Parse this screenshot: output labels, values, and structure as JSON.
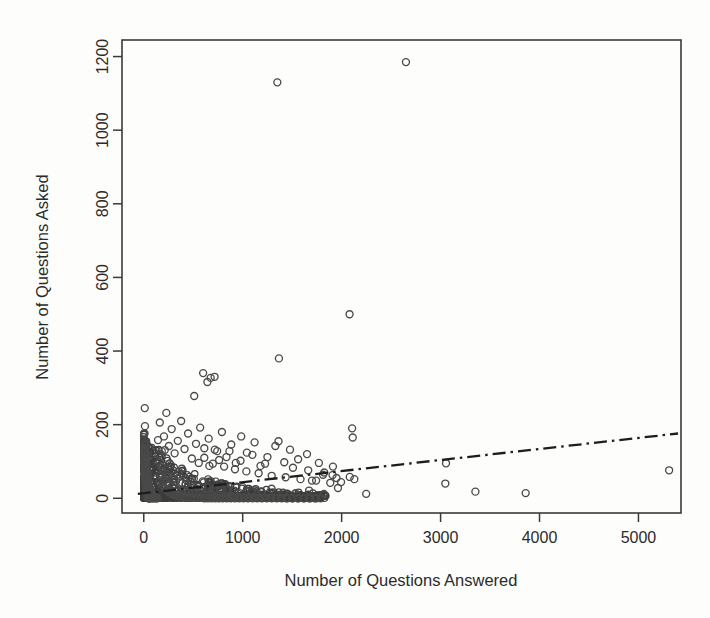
{
  "chart_data": {
    "type": "scatter",
    "title": "",
    "xlabel": "Number of Questions Answered",
    "ylabel": "Number of Questions Asked",
    "xlim": [
      -220,
      5430
    ],
    "ylim": [
      -40,
      1245
    ],
    "xticks": [
      0,
      1000,
      2000,
      3000,
      4000,
      5000
    ],
    "xticklabels": [
      "0",
      "1000",
      "2000",
      "3000",
      "4000",
      "5000"
    ],
    "yticks": [
      0,
      200,
      400,
      600,
      800,
      1000,
      1200
    ],
    "yticklabels": [
      "0",
      "200",
      "400",
      "600",
      "800",
      "1000",
      "1200"
    ],
    "grid": false,
    "legend": null,
    "marker": "open-circle",
    "marker_color": "#4a4a4a",
    "background": "#fdfdfc",
    "frame": "box",
    "series": [
      {
        "name": "users",
        "marker": "open-circle",
        "points": [
          [
            10,
            245
          ],
          [
            12,
            196
          ],
          [
            8,
            176
          ],
          [
            15,
            152
          ],
          [
            9,
            148
          ],
          [
            20,
            143
          ],
          [
            11,
            136
          ],
          [
            16,
            131
          ],
          [
            7,
            126
          ],
          [
            22,
            122
          ],
          [
            13,
            118
          ],
          [
            18,
            114
          ],
          [
            10,
            110
          ],
          [
            25,
            107
          ],
          [
            14,
            103
          ],
          [
            19,
            100
          ],
          [
            8,
            96
          ],
          [
            27,
            93
          ],
          [
            12,
            90
          ],
          [
            21,
            87
          ],
          [
            16,
            84
          ],
          [
            30,
            81
          ],
          [
            11,
            78
          ],
          [
            24,
            76
          ],
          [
            17,
            73
          ],
          [
            33,
            71
          ],
          [
            13,
            68
          ],
          [
            26,
            66
          ],
          [
            19,
            64
          ],
          [
            36,
            62
          ],
          [
            14,
            60
          ],
          [
            29,
            58
          ],
          [
            21,
            56
          ],
          [
            40,
            54
          ],
          [
            15,
            52
          ],
          [
            32,
            50
          ],
          [
            23,
            49
          ],
          [
            44,
            47
          ],
          [
            17,
            45
          ],
          [
            35,
            44
          ],
          [
            25,
            42
          ],
          [
            48,
            41
          ],
          [
            18,
            39
          ],
          [
            38,
            38
          ],
          [
            27,
            37
          ],
          [
            52,
            35
          ],
          [
            20,
            34
          ],
          [
            41,
            33
          ],
          [
            29,
            32
          ],
          [
            57,
            31
          ],
          [
            22,
            29
          ],
          [
            45,
            28
          ],
          [
            31,
            27
          ],
          [
            62,
            26
          ],
          [
            24,
            25
          ],
          [
            49,
            24
          ],
          [
            34,
            23
          ],
          [
            68,
            22
          ],
          [
            26,
            21
          ],
          [
            53,
            20
          ],
          [
            37,
            19
          ],
          [
            74,
            18
          ],
          [
            28,
            17
          ],
          [
            58,
            16
          ],
          [
            40,
            15
          ],
          [
            81,
            14
          ],
          [
            31,
            13
          ],
          [
            63,
            12
          ],
          [
            43,
            11
          ],
          [
            88,
            10
          ],
          [
            34,
            9
          ],
          [
            69,
            8
          ],
          [
            47,
            7
          ],
          [
            96,
            6
          ],
          [
            37,
            5
          ],
          [
            75,
            4
          ],
          [
            51,
            3
          ],
          [
            105,
            2
          ],
          [
            41,
            1
          ],
          [
            82,
            1
          ],
          [
            56,
            0
          ],
          [
            115,
            0
          ],
          [
            46,
            0
          ],
          [
            90,
            0
          ],
          [
            62,
            0
          ],
          [
            126,
            0
          ],
          [
            52,
            0
          ],
          [
            99,
            0
          ],
          [
            69,
            0
          ],
          [
            138,
            0
          ],
          [
            150,
            118
          ],
          [
            163,
            97
          ],
          [
            178,
            84
          ],
          [
            194,
            74
          ],
          [
            212,
            131
          ],
          [
            231,
            66
          ],
          [
            252,
            59
          ],
          [
            275,
            90
          ],
          [
            300,
            53
          ],
          [
            327,
            47
          ],
          [
            356,
            72
          ],
          [
            388,
            42
          ],
          [
            423,
            38
          ],
          [
            461,
            58
          ],
          [
            502,
            34
          ],
          [
            547,
            31
          ],
          [
            596,
            46
          ],
          [
            650,
            28
          ],
          [
            708,
            25
          ],
          [
            772,
            38
          ],
          [
            841,
            23
          ],
          [
            916,
            21
          ],
          [
            998,
            31
          ],
          [
            1088,
            19
          ],
          [
            1186,
            17
          ],
          [
            1292,
            26
          ],
          [
            1408,
            15
          ],
          [
            1534,
            14
          ],
          [
            1671,
            21
          ],
          [
            1821,
            12
          ],
          [
            160,
            45
          ],
          [
            185,
            36
          ],
          [
            207,
            29
          ],
          [
            228,
            22
          ],
          [
            249,
            18
          ],
          [
            271,
            14
          ],
          [
            294,
            11
          ],
          [
            318,
            9
          ],
          [
            343,
            7
          ],
          [
            369,
            5
          ],
          [
            396,
            4
          ],
          [
            424,
            3
          ],
          [
            453,
            2
          ],
          [
            483,
            2
          ],
          [
            514,
            1
          ],
          [
            546,
            1
          ],
          [
            579,
            1
          ],
          [
            613,
            0
          ],
          [
            648,
            0
          ],
          [
            684,
            0
          ],
          [
            721,
            0
          ],
          [
            759,
            0
          ],
          [
            798,
            0
          ],
          [
            838,
            0
          ],
          [
            879,
            0
          ],
          [
            921,
            0
          ],
          [
            964,
            0
          ],
          [
            1008,
            0
          ],
          [
            1053,
            0
          ],
          [
            1099,
            0
          ],
          [
            1146,
            0
          ],
          [
            1194,
            0
          ],
          [
            1243,
            0
          ],
          [
            1293,
            0
          ],
          [
            1344,
            0
          ],
          [
            1396,
            0
          ],
          [
            1449,
            0
          ],
          [
            1503,
            0
          ],
          [
            1558,
            0
          ],
          [
            1614,
            0
          ],
          [
            1671,
            0
          ],
          [
            1729,
            0
          ],
          [
            1788,
            0
          ],
          [
            170,
            62
          ],
          [
            198,
            51
          ],
          [
            226,
            43
          ],
          [
            256,
            37
          ],
          [
            287,
            32
          ],
          [
            319,
            28
          ],
          [
            352,
            25
          ],
          [
            386,
            22
          ],
          [
            421,
            19
          ],
          [
            457,
            17
          ],
          [
            494,
            15
          ],
          [
            532,
            13
          ],
          [
            571,
            12
          ],
          [
            611,
            10
          ],
          [
            652,
            9
          ],
          [
            694,
            8
          ],
          [
            737,
            7
          ],
          [
            781,
            6
          ],
          [
            826,
            5
          ],
          [
            872,
            5
          ],
          [
            919,
            4
          ],
          [
            967,
            3
          ],
          [
            1016,
            3
          ],
          [
            1066,
            2
          ],
          [
            1117,
            2
          ],
          [
            1169,
            2
          ],
          [
            1222,
            1
          ],
          [
            1276,
            1
          ],
          [
            1331,
            1
          ],
          [
            1387,
            1
          ],
          [
            1444,
            0
          ],
          [
            1502,
            0
          ],
          [
            1561,
            0
          ],
          [
            1621,
            0
          ],
          [
            1682,
            0
          ],
          [
            1744,
            0
          ],
          [
            510,
            278
          ],
          [
            600,
            340
          ],
          [
            643,
            316
          ],
          [
            676,
            327
          ],
          [
            716,
            330
          ],
          [
            556,
            96
          ],
          [
            612,
            110
          ],
          [
            663,
            88
          ],
          [
            718,
            132
          ],
          [
            762,
            104
          ],
          [
            812,
            86
          ],
          [
            866,
            128
          ],
          [
            922,
            79
          ],
          [
            978,
            102
          ],
          [
            1037,
            73
          ],
          [
            1098,
            118
          ],
          [
            1161,
            68
          ],
          [
            1226,
            94
          ],
          [
            1293,
            61
          ],
          [
            1362,
            155
          ],
          [
            1366,
            380
          ],
          [
            1434,
            57
          ],
          [
            1508,
            83
          ],
          [
            1584,
            52
          ],
          [
            1662,
            76
          ],
          [
            1742,
            48
          ],
          [
            1824,
            70
          ],
          [
            1350,
            1130
          ],
          [
            1908,
            63
          ],
          [
            1994,
            44
          ],
          [
            2082,
            58
          ],
          [
            1885,
            42
          ],
          [
            1912,
            86
          ],
          [
            1948,
            55
          ],
          [
            2106,
            190
          ],
          [
            2112,
            165
          ],
          [
            2128,
            52
          ],
          [
            2248,
            12
          ],
          [
            2650,
            1185
          ],
          [
            2080,
            500
          ],
          [
            3048,
            40
          ],
          [
            3055,
            95
          ],
          [
            3352,
            18
          ],
          [
            3860,
            14
          ],
          [
            5310,
            76
          ],
          [
            1963,
            28
          ],
          [
            1770,
            96
          ],
          [
            1812,
            64
          ],
          [
            1650,
            120
          ],
          [
            1700,
            48
          ],
          [
            1560,
            106
          ],
          [
            1478,
            132
          ],
          [
            1420,
            98
          ],
          [
            1330,
            142
          ],
          [
            1250,
            112
          ],
          [
            1180,
            88
          ],
          [
            1120,
            152
          ],
          [
            1042,
            124
          ],
          [
            985,
            168
          ],
          [
            930,
            96
          ],
          [
            884,
            146
          ],
          [
            836,
            112
          ],
          [
            790,
            180
          ],
          [
            742,
            128
          ],
          [
            698,
            94
          ],
          [
            656,
            162
          ],
          [
            612,
            136
          ],
          [
            570,
            192
          ],
          [
            528,
            148
          ],
          [
            486,
            108
          ],
          [
            448,
            176
          ],
          [
            412,
            134
          ],
          [
            378,
            210
          ],
          [
            344,
            156
          ],
          [
            312,
            122
          ],
          [
            282,
            188
          ],
          [
            254,
            142
          ],
          [
            228,
            232
          ],
          [
            204,
            168
          ],
          [
            182,
            128
          ],
          [
            162,
            206
          ],
          [
            144,
            158
          ]
        ]
      }
    ],
    "fit_line": {
      "name": "trend-line",
      "style": "dash-dot",
      "color": "#1d1d1d",
      "x_start": -60,
      "y_start": 12,
      "x_end": 5400,
      "y_end": 176
    }
  }
}
